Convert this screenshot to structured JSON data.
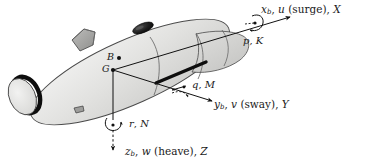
{
  "figure": {
    "colors": {
      "hull_light": "#e3e3e1",
      "hull_mid": "#d2d2d0",
      "hull_dark": "#c2c2c0",
      "outline": "#3a3a3a",
      "ink": "#1a1a1a",
      "accent_black": "#111111",
      "fin_gray": "#a8a8a6",
      "background": "#ffffff"
    }
  },
  "points": {
    "buoyancy": "B",
    "gravity": "G"
  },
  "axes": {
    "x": {
      "symbol": "x",
      "subscript": "b",
      "velocity": "u",
      "motion": "(surge)",
      "force": "X",
      "label": "xₙ, u (surge), X"
    },
    "y": {
      "symbol": "y",
      "subscript": "b",
      "velocity": "v",
      "motion": "(sway)",
      "force": "Y",
      "label": "yₙ, v (sway), Y"
    },
    "z": {
      "symbol": "z",
      "subscript": "b",
      "velocity": "w",
      "motion": "(heave)",
      "force": "Z",
      "label": "zₙ, w (heave), Z"
    }
  },
  "rotations": {
    "roll": {
      "rate": "p",
      "moment": "K",
      "label": "p, K"
    },
    "pitch": {
      "rate": "q",
      "moment": "M",
      "label": "q, M"
    },
    "yaw": {
      "rate": "r",
      "moment": "N",
      "label": "r, N"
    }
  },
  "vehicle": {
    "name": "autonomous-underwater-vehicle",
    "parts": [
      "nose-ring",
      "hull",
      "dorsal-fin",
      "sensor-dome",
      "side-strake",
      "ventral-pod"
    ]
  }
}
